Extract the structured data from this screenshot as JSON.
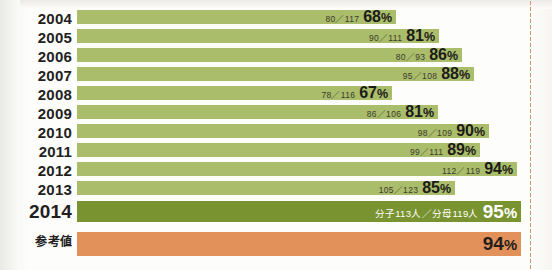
{
  "chart_data": {
    "type": "bar",
    "title": "",
    "xlabel": "",
    "ylabel": "",
    "orientation": "horizontal",
    "grid": false,
    "legend": "none",
    "xlim": [
      0,
      100
    ],
    "categories": [
      "2004",
      "2005",
      "2006",
      "2007",
      "2008",
      "2009",
      "2010",
      "2011",
      "2012",
      "2013",
      "2014",
      "参考値"
    ],
    "values": [
      68,
      81,
      86,
      88,
      67,
      81,
      90,
      89,
      94,
      85,
      95,
      94
    ],
    "value_suffix": "%",
    "rows": [
      {
        "label": "2004",
        "numerator": 80,
        "denominator": 117,
        "fraction": "80／117",
        "percent": 68,
        "percent_text": "68",
        "color": "#a9bd6b",
        "bar_end_px": 396
      },
      {
        "label": "2005",
        "numerator": 90,
        "denominator": 111,
        "fraction": "90／111",
        "percent": 81,
        "percent_text": "81",
        "color": "#a9bd6b",
        "bar_end_px": 439
      },
      {
        "label": "2006",
        "numerator": 80,
        "denominator": 93,
        "fraction": "80／93",
        "percent": 86,
        "percent_text": "86",
        "color": "#a9bd6b",
        "bar_end_px": 462
      },
      {
        "label": "2007",
        "numerator": 95,
        "denominator": 108,
        "fraction": "95／108",
        "percent": 88,
        "percent_text": "88",
        "color": "#a9bd6b",
        "bar_end_px": 474
      },
      {
        "label": "2008",
        "numerator": 78,
        "denominator": 116,
        "fraction": "78／116",
        "percent": 67,
        "percent_text": "67",
        "color": "#a9bd6b",
        "bar_end_px": 392
      },
      {
        "label": "2009",
        "numerator": 86,
        "denominator": 106,
        "fraction": "86／106",
        "percent": 81,
        "percent_text": "81",
        "color": "#a9bd6b",
        "bar_end_px": 438
      },
      {
        "label": "2010",
        "numerator": 98,
        "denominator": 109,
        "fraction": "98／109",
        "percent": 90,
        "percent_text": "90",
        "color": "#a9bd6b",
        "bar_end_px": 489
      },
      {
        "label": "2011",
        "numerator": 99,
        "denominator": 111,
        "fraction": "99／111",
        "percent": 89,
        "percent_text": "89",
        "color": "#a9bd6b",
        "bar_end_px": 480
      },
      {
        "label": "2012",
        "numerator": 112,
        "denominator": 119,
        "fraction": "112／119",
        "percent": 94,
        "percent_text": "94",
        "color": "#a9bd6b",
        "bar_end_px": 517
      },
      {
        "label": "2013",
        "numerator": 105,
        "denominator": 123,
        "fraction": "105／123",
        "percent": 85,
        "percent_text": "85",
        "color": "#a9bd6b",
        "bar_end_px": 455
      },
      {
        "label": "2014",
        "numerator": 113,
        "denominator": 119,
        "fraction": "分子113人／分母119人",
        "percent": 95,
        "percent_text": "95",
        "color": "#78932f",
        "bar_end_px": 521
      },
      {
        "label": "参考値",
        "label_sup": "2)",
        "fraction": "",
        "percent": 94,
        "percent_text": "94",
        "color": "#e3915b",
        "bar_end_px": 521
      }
    ]
  },
  "style": {
    "bar_green": "#a9bd6b",
    "bar_green_2014": "#78932f",
    "bar_orange": "#e3915b",
    "background": "#fdfdfb",
    "text_dark": "#231f1e",
    "dotted_rule": "#d9956a"
  },
  "percent_symbol": "%"
}
